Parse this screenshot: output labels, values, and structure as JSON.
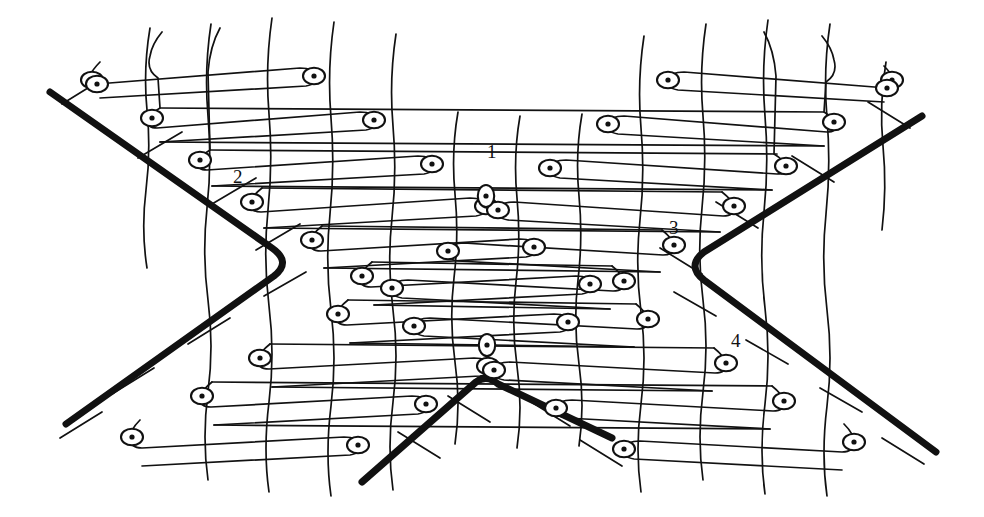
{
  "figure": {
    "kind": "technical-line-diagram",
    "background_color": "#ffffff",
    "ink_color": "#111111",
    "thin_stroke_width": 1.7,
    "bold_stroke_width": 7.0,
    "tick_stroke_width": 1.7,
    "canvas": {
      "width": 984,
      "height": 517
    }
  },
  "callouts": [
    {
      "id": "1",
      "label": "1",
      "x": 487,
      "y": 152,
      "points_to": "loop-stitch-center-top"
    },
    {
      "id": "2",
      "label": "2",
      "x": 233,
      "y": 177,
      "points_to": "loop-stitch-left-edge"
    },
    {
      "id": "3",
      "label": "3",
      "x": 669,
      "y": 228,
      "points_to": "loop-stitch-right-edge"
    },
    {
      "id": "4",
      "label": "4",
      "x": 731,
      "y": 341,
      "points_to": "loop-stitch-lower-right"
    }
  ],
  "bold_outline": {
    "name": "cut-boundary",
    "description": "Two crossing bold strokes forming an X / hourglass: upper-left to center-left vertex to lower-left, and upper-right to center-right vertex to lower-right, plus a bottom chevron apex.",
    "segments": [
      {
        "name": "upper-left-arm",
        "points": [
          [
            50,
            92
          ],
          [
            292,
            262
          ]
        ]
      },
      {
        "name": "lower-left-arm",
        "points": [
          [
            292,
            262
          ],
          [
            66,
            424
          ]
        ]
      },
      {
        "name": "upper-right-arm",
        "points": [
          [
            922,
            116
          ],
          [
            686,
            266
          ]
        ]
      },
      {
        "name": "lower-right-arm",
        "points": [
          [
            686,
            266
          ],
          [
            936,
            452
          ]
        ]
      },
      {
        "name": "bottom-chevron-left",
        "points": [
          [
            362,
            482
          ],
          [
            487,
            377
          ]
        ]
      },
      {
        "name": "bottom-chevron-right",
        "points": [
          [
            487,
            377
          ],
          [
            612,
            438
          ]
        ]
      }
    ],
    "left_vertex": [
      292,
      262
    ],
    "right_vertex": [
      686,
      266
    ],
    "bottom_apex": [
      487,
      377
    ]
  },
  "mesh": {
    "name": "knit-mesh",
    "course_rows": 13,
    "wale_columns": 9,
    "loop_eyes_total": 44,
    "row_spacing_px": 31,
    "column_spacing_px": 62,
    "loop_eye": {
      "rx": 11,
      "ry": 8,
      "dot_r": 2.6
    },
    "tick_marks_on_boundary": 12
  },
  "chart_data": null
}
